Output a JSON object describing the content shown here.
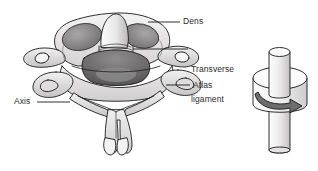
{
  "figure": {
    "background_color": "#ffffff",
    "width": 318,
    "height": 171
  },
  "labels": {
    "dens": "Dens",
    "transverse_line1": "Transverse",
    "transverse_line2": "ligament",
    "atlas": "Atlas",
    "axis": "Axis"
  },
  "colors": {
    "outline": "#1a1a1a",
    "bone_light": "#eceaea",
    "bone_mid": "#c9c7c7",
    "bone_shadow": "#8f8d8d",
    "cavity_dark": "#6b6a6a",
    "leader_line": "#1a1a1a",
    "arrow_fill": "#6e6d6d",
    "cylinder_light": "#f2f1f1",
    "cylinder_mid": "#d8d7d7"
  },
  "illustrations": {
    "left": {
      "name": "cervical-vertebrae-superior-view",
      "parts": [
        "dens",
        "transverse-ligament",
        "atlas-ring",
        "axis-body",
        "transverse-processes",
        "spinous-process",
        "vertebral-foramen"
      ]
    },
    "right": {
      "name": "pivot-joint-mechanical-model",
      "parts": [
        "vertical-peg",
        "rotating-disc",
        "rotation-arrow"
      ]
    }
  },
  "leader_lines": {
    "dens": {
      "x1": 148,
      "y1": 22,
      "x2": 180,
      "y2": 22
    },
    "transverse": {
      "x1": 133,
      "y1": 49,
      "x2": 188,
      "y2": 49
    },
    "atlas": {
      "x1": 166,
      "y1": 85,
      "x2": 190,
      "y2": 85
    },
    "axis": {
      "x1": 37,
      "y1": 102,
      "x2": 70,
      "y2": 102
    }
  }
}
